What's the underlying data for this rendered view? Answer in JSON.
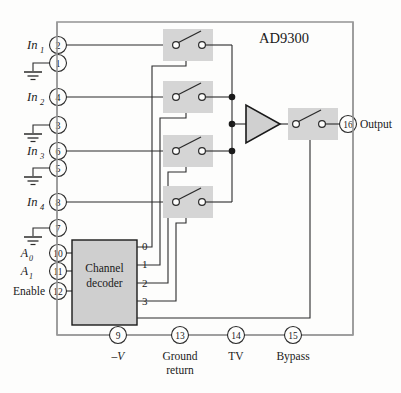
{
  "device": {
    "part_number": "AD9300",
    "title": "AD9300 4-channel multiplexer block diagram"
  },
  "decoder": {
    "line1": "Channel",
    "line2": "decoder",
    "outputs": [
      "0",
      "1",
      "2",
      "3"
    ]
  },
  "inputs": [
    {
      "signal": "In",
      "subscript": "1",
      "pin": "2"
    },
    {
      "signal": "In",
      "subscript": "2",
      "pin": "4"
    },
    {
      "signal": "In",
      "subscript": "3",
      "pin": "6"
    },
    {
      "signal": "In",
      "subscript": "4",
      "pin": "8"
    }
  ],
  "grounds": [
    {
      "pin": "1"
    },
    {
      "pin": "3"
    },
    {
      "pin": "5"
    },
    {
      "pin": "7"
    }
  ],
  "control_pins": [
    {
      "label": "A",
      "subscript": "0",
      "pin": "10"
    },
    {
      "label": "A",
      "subscript": "1",
      "pin": "11"
    },
    {
      "label": "Enable",
      "subscript": "",
      "pin": "12"
    }
  ],
  "output_pin": {
    "pin": "16",
    "label": "Output"
  },
  "bottom_pins": [
    {
      "pin": "9",
      "label": "–V",
      "label2": ""
    },
    {
      "pin": "13",
      "label": "Ground",
      "label2": "return"
    },
    {
      "pin": "14",
      "label": "TV",
      "label2": ""
    },
    {
      "pin": "15",
      "label": "Bypass",
      "label2": ""
    }
  ],
  "colors": {
    "wire": "#2b2b2b",
    "boundary": "#8a8a8a",
    "block_fill": "#cfcfcf",
    "switch_fill": "#d5d5d5",
    "amp_fill": "#d0d0d0",
    "text": "#1a1a1a",
    "background": "#fdfdfc"
  }
}
